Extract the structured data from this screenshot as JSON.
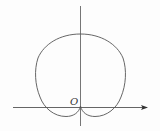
{
  "diagram": {
    "type": "polar-curve",
    "origin_label": "O",
    "colors": {
      "curve": "#555555",
      "axis": "#555555",
      "background": "#fdfdfd"
    }
  }
}
